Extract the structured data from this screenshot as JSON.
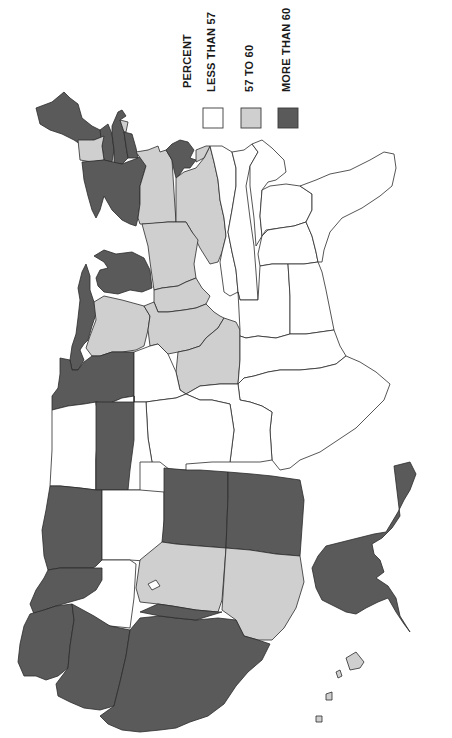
{
  "legend": {
    "title": "PERCENT",
    "items": [
      {
        "label": "LESS THAN 57",
        "class": "lo",
        "color": "#ffffff"
      },
      {
        "label": "57 TO 60",
        "class": "mid",
        "color": "#cfcfcf"
      },
      {
        "label": "MORE THAN 60",
        "class": "hi",
        "color": "#5a5a5a"
      }
    ]
  },
  "map": {
    "orientation": "rotated 90° clockwise (north at left)",
    "colors": {
      "less_than_57": "#ffffff",
      "57_to_60": "#cfcfcf",
      "more_than_60": "#5a5a5a",
      "border": "#2b2b2b"
    }
  }
}
